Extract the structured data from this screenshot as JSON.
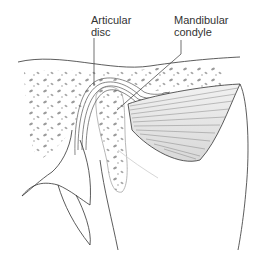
{
  "figure": {
    "labels": [
      {
        "id": "articular-disc",
        "lines": [
          "Articular",
          "disc"
        ]
      },
      {
        "id": "mandibular-condyle",
        "lines": [
          "Mandibular",
          "condyle"
        ]
      }
    ]
  },
  "colors": {
    "line": "#333333",
    "bone_spots": "#9a9a9a",
    "muscle_fill": "#e6e6e6",
    "muscle_lines": "#7a7a7a",
    "background": "#ffffff"
  }
}
